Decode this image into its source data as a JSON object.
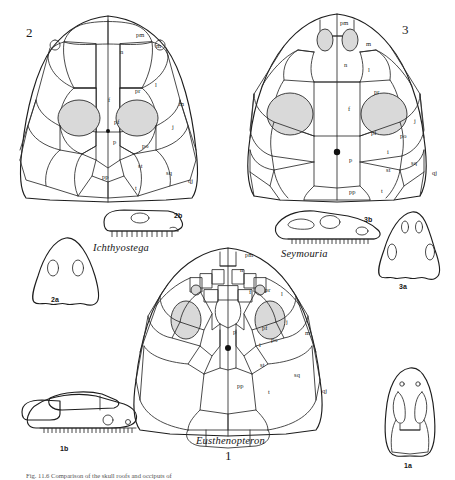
{
  "figure": {
    "caption": "Fig. 11.6  Comparison of the skull roofs and occiputs of",
    "orbit_color": "#d9d9d9",
    "line_color": "#2b2b2b"
  },
  "panels": [
    {
      "id": "ichthyostega",
      "number": "2",
      "taxon": "Ichthyostega",
      "lateral_label": "2b",
      "occipital_label": "2a",
      "bone_labels": [
        {
          "code": "pm",
          "x": 140,
          "y": 35
        },
        {
          "code": "n",
          "x": 124,
          "y": 52
        },
        {
          "code": "m",
          "x": 160,
          "y": 46
        },
        {
          "code": "l",
          "x": 159,
          "y": 85
        },
        {
          "code": "pr",
          "x": 139,
          "y": 91
        },
        {
          "code": "f",
          "x": 112,
          "y": 100
        },
        {
          "code": "m",
          "x": 183,
          "y": 104
        },
        {
          "code": "pf",
          "x": 118,
          "y": 122
        },
        {
          "code": "j",
          "x": 176,
          "y": 127
        },
        {
          "code": "p",
          "x": 117,
          "y": 142
        },
        {
          "code": "po",
          "x": 146,
          "y": 146
        },
        {
          "code": "st",
          "x": 142,
          "y": 166
        },
        {
          "code": "sq",
          "x": 170,
          "y": 173
        },
        {
          "code": "pp",
          "x": 106,
          "y": 177
        },
        {
          "code": "qj",
          "x": 192,
          "y": 181
        },
        {
          "code": "t",
          "x": 139,
          "y": 188
        }
      ]
    },
    {
      "id": "seymouria",
      "number": "3",
      "taxon": "Seymouria",
      "lateral_label": "3b",
      "occipital_label": "3a",
      "bone_labels": [
        {
          "code": "pm",
          "x": 344,
          "y": 23
        },
        {
          "code": "m",
          "x": 370,
          "y": 44
        },
        {
          "code": "n",
          "x": 348,
          "y": 65
        },
        {
          "code": "l",
          "x": 372,
          "y": 70
        },
        {
          "code": "pr",
          "x": 378,
          "y": 92
        },
        {
          "code": "f",
          "x": 352,
          "y": 109
        },
        {
          "code": "pf",
          "x": 375,
          "y": 133
        },
        {
          "code": "j",
          "x": 418,
          "y": 121
        },
        {
          "code": "po",
          "x": 404,
          "y": 136
        },
        {
          "code": "i",
          "x": 391,
          "y": 152
        },
        {
          "code": "p",
          "x": 353,
          "y": 160
        },
        {
          "code": "st",
          "x": 390,
          "y": 170
        },
        {
          "code": "sq",
          "x": 415,
          "y": 163
        },
        {
          "code": "qj",
          "x": 436,
          "y": 173
        },
        {
          "code": "pp",
          "x": 353,
          "y": 192
        },
        {
          "code": "t",
          "x": 385,
          "y": 191
        }
      ]
    },
    {
      "id": "eusthenopteron",
      "number": "1",
      "taxon": "Eusthenopteron",
      "lateral_label": "1b",
      "occipital_label": "1a",
      "bone_labels": [
        {
          "code": "pm",
          "x": 249,
          "y": 255
        },
        {
          "code": "n",
          "x": 244,
          "y": 270
        },
        {
          "code": "pr",
          "x": 269,
          "y": 290
        },
        {
          "code": "f",
          "x": 253,
          "y": 292
        },
        {
          "code": "l",
          "x": 285,
          "y": 294
        },
        {
          "code": "j",
          "x": 290,
          "y": 322
        },
        {
          "code": "pf",
          "x": 266,
          "y": 328
        },
        {
          "code": "po",
          "x": 275,
          "y": 340
        },
        {
          "code": "m",
          "x": 309,
          "y": 333
        },
        {
          "code": "p",
          "x": 237,
          "y": 332
        },
        {
          "code": "i",
          "x": 263,
          "y": 345
        },
        {
          "code": "st",
          "x": 264,
          "y": 365
        },
        {
          "code": "sq",
          "x": 298,
          "y": 375
        },
        {
          "code": "pp",
          "x": 241,
          "y": 386
        },
        {
          "code": "t",
          "x": 272,
          "y": 392
        },
        {
          "code": "qj",
          "x": 326,
          "y": 391
        }
      ]
    }
  ]
}
